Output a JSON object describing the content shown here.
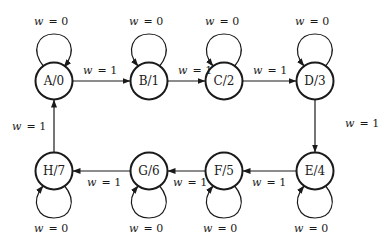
{
  "diagram": {
    "type": "state-diagram",
    "nodes": [
      {
        "id": "A",
        "label": "A/0",
        "cx": 54,
        "cy": 81
      },
      {
        "id": "B",
        "label": "B/1",
        "cx": 149,
        "cy": 81
      },
      {
        "id": "C",
        "label": "C/2",
        "cx": 224,
        "cy": 81
      },
      {
        "id": "D",
        "label": "D/3",
        "cx": 315,
        "cy": 81
      },
      {
        "id": "E",
        "label": "E/4",
        "cx": 315,
        "cy": 171
      },
      {
        "id": "F",
        "label": "F/5",
        "cx": 224,
        "cy": 171
      },
      {
        "id": "G",
        "label": "G/6",
        "cx": 149,
        "cy": 171
      },
      {
        "id": "H",
        "label": "H/7",
        "cx": 54,
        "cy": 171
      }
    ],
    "transitions": [
      {
        "from": "A",
        "to": "B",
        "condition": "w = 1",
        "var": "w",
        "value": "= 1"
      },
      {
        "from": "B",
        "to": "C",
        "condition": "w = 1",
        "var": "w",
        "value": "= 1"
      },
      {
        "from": "C",
        "to": "D",
        "condition": "w = 1",
        "var": "w",
        "value": "= 1"
      },
      {
        "from": "D",
        "to": "E",
        "condition": "w = 1",
        "var": "w",
        "value": "= 1"
      },
      {
        "from": "E",
        "to": "F",
        "condition": "w = 1",
        "var": "w",
        "value": "= 1"
      },
      {
        "from": "F",
        "to": "G",
        "condition": "w = 1",
        "var": "w",
        "value": "= 1"
      },
      {
        "from": "G",
        "to": "H",
        "condition": "w = 1",
        "var": "w",
        "value": "= 1"
      },
      {
        "from": "H",
        "to": "A",
        "condition": "w = 1",
        "var": "w",
        "value": "= 1"
      }
    ],
    "self_loops": [
      {
        "node": "A",
        "condition": "w = 0",
        "var": "w",
        "value": "= 0",
        "side": "top"
      },
      {
        "node": "B",
        "condition": "w = 0",
        "var": "w",
        "value": "= 0",
        "side": "top"
      },
      {
        "node": "C",
        "condition": "w = 0",
        "var": "w",
        "value": "= 0",
        "side": "top"
      },
      {
        "node": "D",
        "condition": "w = 0",
        "var": "w",
        "value": "= 0",
        "side": "top"
      },
      {
        "node": "E",
        "condition": "w = 0",
        "var": "w",
        "value": "= 0",
        "side": "bottom"
      },
      {
        "node": "F",
        "condition": "w = 0",
        "var": "w",
        "value": "= 0",
        "side": "bottom"
      },
      {
        "node": "G",
        "condition": "w = 0",
        "var": "w",
        "value": "= 0",
        "side": "bottom"
      },
      {
        "node": "H",
        "condition": "w = 0",
        "var": "w",
        "value": "= 0",
        "side": "bottom"
      }
    ]
  }
}
